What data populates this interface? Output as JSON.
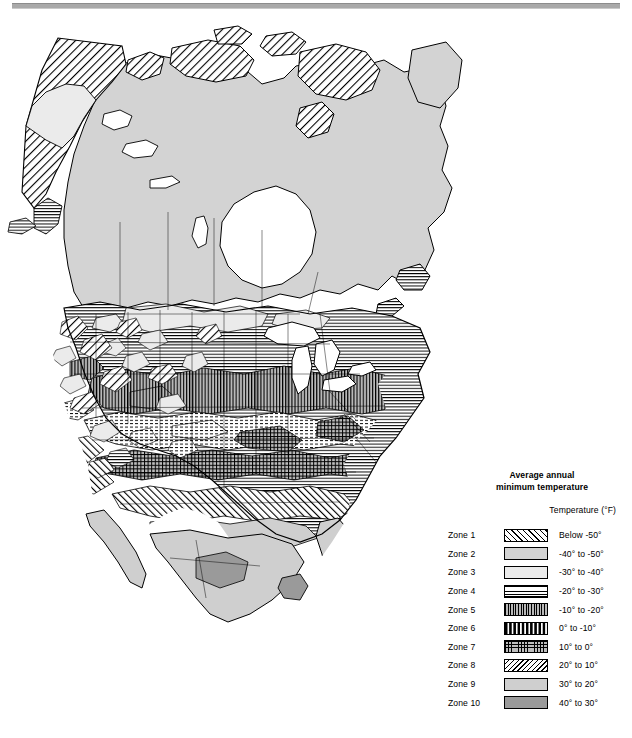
{
  "figure": {
    "kind": "thematic-map",
    "region": "North America"
  },
  "legend": {
    "title_line1": "Average annual",
    "title_line2": "minimum temperature",
    "subtitle": "Temperature (°F)",
    "rows": [
      {
        "zone": "Zone 1",
        "temp": "Below -50°",
        "pattern": "diagonal-hatch-right",
        "swatch_class": "sw-z1"
      },
      {
        "zone": "Zone 2",
        "temp": "-40° to -50°",
        "pattern": "solid-gray-medium",
        "swatch_class": "sw-z2"
      },
      {
        "zone": "Zone 3",
        "temp": "-30° to -40°",
        "pattern": "solid-gray-light",
        "swatch_class": "sw-z3"
      },
      {
        "zone": "Zone 4",
        "temp": "-20° to -30°",
        "pattern": "horizontal-lines",
        "swatch_class": "sw-z4"
      },
      {
        "zone": "Zone 5",
        "temp": "-10° to -20°",
        "pattern": "vertical-lines",
        "swatch_class": "sw-z5"
      },
      {
        "zone": "Zone 6",
        "temp": "0° to -10°",
        "pattern": "dashed-horizontal",
        "swatch_class": "sw-z6"
      },
      {
        "zone": "Zone 7",
        "temp": "10° to 0°",
        "pattern": "grid-crosshatch",
        "swatch_class": "sw-z7"
      },
      {
        "zone": "Zone 8",
        "temp": "20° to 10°",
        "pattern": "diagonal-hatch-left",
        "swatch_class": "sw-z8"
      },
      {
        "zone": "Zone 9",
        "temp": "30° to 20°",
        "pattern": "solid-gray",
        "swatch_class": "sw-z9"
      },
      {
        "zone": "Zone 10",
        "temp": "40° to 30°",
        "pattern": "solid-gray-dark",
        "swatch_class": "sw-z10"
      }
    ]
  },
  "colors": {
    "zone2_gray": "#d3d3d3",
    "zone3_gray": "#ebebeb",
    "zone5_gray": "#b9b9b9",
    "zone7_gray": "#bdbdbd",
    "zone9_gray": "#cfcfcf",
    "zone10_gray": "#9a9a9a",
    "outline": "#000000",
    "water": "#ffffff",
    "page_rule": "#a9a9a9"
  }
}
